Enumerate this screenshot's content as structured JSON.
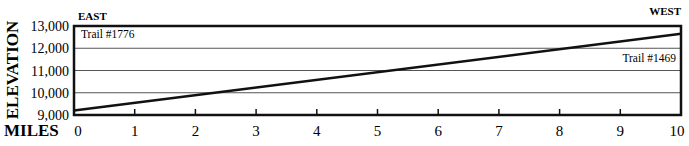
{
  "chart_data": {
    "type": "line",
    "title": "",
    "xlabel": "MILES",
    "ylabel": "ELEVATION",
    "direction_labels": {
      "left": "EAST",
      "right": "WEST"
    },
    "x_ticks": [
      0,
      1,
      2,
      3,
      4,
      5,
      6,
      7,
      8,
      9,
      10
    ],
    "y_ticks": [
      "9,000",
      "10,000",
      "11,000",
      "12,000",
      "13,000"
    ],
    "xlim": [
      0,
      10
    ],
    "ylim": [
      9000,
      13000
    ],
    "grid": {
      "horizontal": true,
      "vertical": false
    },
    "annotations": [
      {
        "text": "Trail #1776",
        "position": "top-left"
      },
      {
        "text": "Trail #1469",
        "position": "right, between 11,000 and 12,000"
      }
    ],
    "series": [
      {
        "name": "Elevation profile",
        "x": [
          0,
          10
        ],
        "values": [
          9200,
          12650
        ]
      }
    ]
  }
}
